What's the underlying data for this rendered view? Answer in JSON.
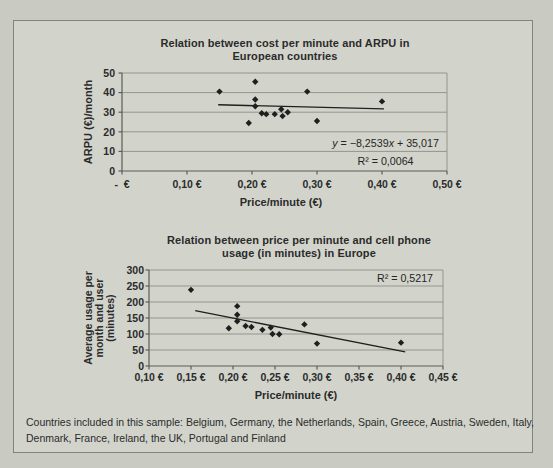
{
  "page": {
    "countries_note_lines": [
      "Countries included in this sample: Belgium, Germany, the Netherlands, Spain, Greece, Austria, Sweden, Italy,",
      "Denmark, France, Ireland, the UK, Portugal and Finland"
    ]
  },
  "colors": {
    "background": "#c9cbc3",
    "frame_fill": "#d2d4cc",
    "frame_border": "#82837c",
    "gridline": "#94958d",
    "axis": "#5c5d56",
    "marker": "#1f1f1f",
    "trendline": "#1f1f1f",
    "text": "#2b2b2b"
  },
  "chart_data": [
    {
      "type": "scatter",
      "title": "Relation between cost per minute and ARPU in European countries",
      "title_lines": [
        "Relation between cost per minute and ARPU in",
        "European countries"
      ],
      "xlabel": "Price/minute (€)",
      "ylabel": "ARPU (€)/month",
      "xlim": [
        0,
        0.5
      ],
      "ylim": [
        0,
        50
      ],
      "x_ticks": [
        0,
        0.1,
        0.2,
        0.3,
        0.4,
        0.5
      ],
      "x_tick_labels": [
        "-  €",
        "0,10 €",
        "0,20 €",
        "0,30 €",
        "0,40 €",
        "0,50 €"
      ],
      "y_ticks": [
        0,
        10,
        20,
        30,
        40,
        50
      ],
      "y_tick_labels": [
        "0",
        "10",
        "20",
        "30",
        "40",
        "50"
      ],
      "grid": "horizontal",
      "legend": "none",
      "marker": "diamond",
      "points": [
        [
          0.15,
          40.5
        ],
        [
          0.195,
          24.5
        ],
        [
          0.205,
          45.5
        ],
        [
          0.205,
          36.5
        ],
        [
          0.205,
          33
        ],
        [
          0.215,
          29.5
        ],
        [
          0.222,
          29
        ],
        [
          0.235,
          29
        ],
        [
          0.245,
          31.5
        ],
        [
          0.247,
          28
        ],
        [
          0.255,
          30
        ],
        [
          0.285,
          40.5
        ],
        [
          0.3,
          25.5
        ],
        [
          0.4,
          35.5
        ]
      ],
      "trendline": {
        "x1": 0.148,
        "y1": 33.8,
        "x2": 0.403,
        "y2": 31.7
      },
      "equation": {
        "var1": "y",
        "mid": " = −8,2539",
        "var2": "x",
        "end": " + 35,017"
      },
      "r_squared_label": "R² = 0,0064"
    },
    {
      "type": "scatter",
      "title": "Relation between price per minute and cell phone usage (in minutes) in Europe",
      "title_lines": [
        "Relation between price per minute and cell phone",
        "usage (in minutes) in Europe"
      ],
      "xlabel": "Price/minute (€)",
      "ylabel": "Average usage per month and user (minutes)",
      "ylabel_lines": [
        "Average usage per",
        "month and user",
        "(minutes)"
      ],
      "xlim": [
        0.1,
        0.45
      ],
      "ylim": [
        0,
        300
      ],
      "x_ticks": [
        0.1,
        0.15,
        0.2,
        0.25,
        0.3,
        0.35,
        0.4,
        0.45
      ],
      "x_tick_labels": [
        "0,10 €",
        "0,15 €",
        "0,20 €",
        "0,25 €",
        "0,30 €",
        "0,35 €",
        "0,40 €",
        "0,45 €"
      ],
      "y_ticks": [
        0,
        50,
        100,
        150,
        200,
        250,
        300
      ],
      "y_tick_labels": [
        "0",
        "50",
        "100",
        "150",
        "200",
        "250",
        "300"
      ],
      "grid": "horizontal",
      "legend": "none",
      "marker": "diamond",
      "points": [
        [
          0.15,
          238
        ],
        [
          0.195,
          118
        ],
        [
          0.205,
          187
        ],
        [
          0.205,
          160
        ],
        [
          0.205,
          140
        ],
        [
          0.215,
          125
        ],
        [
          0.222,
          122
        ],
        [
          0.235,
          113
        ],
        [
          0.245,
          120
        ],
        [
          0.247,
          100
        ],
        [
          0.255,
          99
        ],
        [
          0.285,
          130
        ],
        [
          0.3,
          70
        ],
        [
          0.4,
          73
        ]
      ],
      "trendline": {
        "x1": 0.155,
        "y1": 173,
        "x2": 0.405,
        "y2": 44
      },
      "r_squared_label": "R² = 0,5217"
    }
  ]
}
